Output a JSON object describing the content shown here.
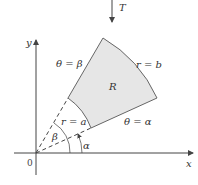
{
  "diagram": {
    "transform_label": "T",
    "axes": {
      "x_label": "x",
      "y_label": "y",
      "origin_label": "0"
    },
    "region_label": "R",
    "boundaries": {
      "outer_arc": "r = b",
      "inner_arc": "r = a",
      "upper_ray": "θ = β",
      "lower_ray": "θ = α"
    },
    "angles": {
      "alpha": "α",
      "beta": "β"
    },
    "colors": {
      "region_fill": "#e6e6e6",
      "stroke": "#555555"
    }
  }
}
